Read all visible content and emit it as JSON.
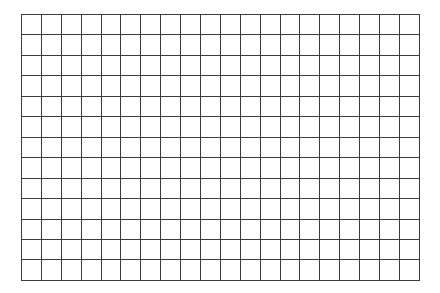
{
  "page": {
    "kind": "grid-paper",
    "background_color": "#ffffff",
    "canvas_width": 440,
    "canvas_height": 293
  },
  "grid": {
    "columns": 20,
    "rows": 13,
    "cell_width_px": 19.9,
    "cell_height_px": 20.46,
    "line_color": "#3b3b3b",
    "line_width_px": 1,
    "cell_fill_color": "#fefefe",
    "offset_left_px": 21,
    "offset_top_px": 14,
    "grid_width_px": 398,
    "grid_height_px": 266,
    "cell_text": ""
  },
  "labels": {
    "column_headers": [],
    "row_headers": []
  },
  "annotations": []
}
